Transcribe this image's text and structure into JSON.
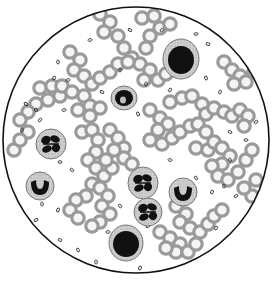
{
  "image": {
    "subject": "Blood smear viewed through microscope field",
    "width": 273,
    "height": 281
  },
  "field": {
    "cx": 136,
    "cy": 140,
    "r": 133,
    "border_color": "#111111",
    "bg": "#ffffff"
  },
  "colors": {
    "rbc_ring": "#9a9a9a",
    "rbc_center": "#f4f4f4",
    "wbc_cytoplasm": "#c8c8c8",
    "wbc_nucleus": "#111111",
    "platelet": "#333333"
  },
  "rbc_chains": [
    [
      [
        100,
        14
      ],
      [
        110,
        22
      ],
      [
        104,
        32
      ],
      [
        118,
        36
      ],
      [
        124,
        48
      ],
      [
        132,
        58
      ],
      [
        140,
        64
      ],
      [
        150,
        70
      ],
      [
        144,
        80
      ],
      [
        158,
        80
      ],
      [
        166,
        74
      ]
    ],
    [
      [
        70,
        52
      ],
      [
        80,
        60
      ],
      [
        74,
        70
      ],
      [
        84,
        76
      ],
      [
        92,
        84
      ],
      [
        100,
        78
      ],
      [
        110,
        72
      ],
      [
        118,
        64
      ],
      [
        128,
        62
      ]
    ],
    [
      [
        142,
        18
      ],
      [
        154,
        16
      ],
      [
        160,
        28
      ],
      [
        170,
        24
      ],
      [
        150,
        36
      ],
      [
        146,
        48
      ]
    ],
    [
      [
        40,
        88
      ],
      [
        52,
        86
      ],
      [
        60,
        96
      ],
      [
        48,
        100
      ],
      [
        36,
        104
      ],
      [
        28,
        112
      ],
      [
        20,
        120
      ],
      [
        28,
        132
      ]
    ],
    [
      [
        62,
        86
      ],
      [
        72,
        92
      ],
      [
        84,
        96
      ],
      [
        90,
        106
      ],
      [
        78,
        110
      ],
      [
        90,
        116
      ],
      [
        100,
        108
      ]
    ],
    [
      [
        14,
        150
      ],
      [
        20,
        140
      ]
    ],
    [
      [
        82,
        132
      ],
      [
        92,
        130
      ],
      [
        98,
        140
      ],
      [
        96,
        152
      ],
      [
        88,
        160
      ],
      [
        96,
        168
      ],
      [
        104,
        176
      ],
      [
        92,
        184
      ],
      [
        86,
        196
      ],
      [
        76,
        200
      ],
      [
        70,
        210
      ],
      [
        78,
        218
      ]
    ],
    [
      [
        110,
        130
      ],
      [
        118,
        138
      ],
      [
        124,
        148
      ],
      [
        114,
        150
      ],
      [
        124,
        158
      ],
      [
        132,
        164
      ],
      [
        112,
        168
      ],
      [
        106,
        160
      ]
    ],
    [
      [
        100,
        188
      ],
      [
        108,
        196
      ],
      [
        102,
        206
      ],
      [
        110,
        214
      ],
      [
        100,
        222
      ],
      [
        92,
        226
      ]
    ],
    [
      [
        170,
        102
      ],
      [
        182,
        98
      ],
      [
        192,
        96
      ],
      [
        202,
        104
      ],
      [
        206,
        114
      ],
      [
        214,
        108
      ],
      [
        224,
        112
      ],
      [
        232,
        116
      ],
      [
        240,
        110
      ],
      [
        248,
        116
      ],
      [
        244,
        126
      ]
    ],
    [
      [
        150,
        110
      ],
      [
        160,
        118
      ],
      [
        168,
        124
      ],
      [
        158,
        130
      ],
      [
        150,
        140
      ],
      [
        162,
        144
      ],
      [
        172,
        138
      ],
      [
        180,
        132
      ],
      [
        190,
        126
      ],
      [
        198,
        124
      ],
      [
        206,
        132
      ]
    ],
    [
      [
        196,
        148
      ],
      [
        208,
        150
      ],
      [
        214,
        142
      ],
      [
        222,
        148
      ],
      [
        230,
        156
      ],
      [
        222,
        164
      ],
      [
        212,
        166
      ],
      [
        218,
        176
      ],
      [
        228,
        180
      ],
      [
        238,
        172
      ],
      [
        246,
        160
      ],
      [
        252,
        150
      ]
    ],
    [
      [
        224,
        62
      ],
      [
        232,
        70
      ],
      [
        240,
        76
      ],
      [
        234,
        84
      ],
      [
        246,
        82
      ],
      [
        254,
        72
      ]
    ],
    [
      [
        176,
        206
      ],
      [
        186,
        214
      ],
      [
        180,
        222
      ],
      [
        190,
        228
      ],
      [
        200,
        232
      ],
      [
        208,
        224
      ],
      [
        214,
        216
      ],
      [
        222,
        210
      ]
    ],
    [
      [
        160,
        232
      ],
      [
        170,
        238
      ],
      [
        180,
        244
      ],
      [
        176,
        252
      ],
      [
        166,
        248
      ],
      [
        188,
        252
      ],
      [
        196,
        244
      ]
    ],
    [
      [
        252,
        196
      ],
      [
        244,
        188
      ],
      [
        256,
        180
      ]
    ]
  ],
  "wbcs": [
    {
      "type": "lymphocyte",
      "cx": 181,
      "cy": 59,
      "rx": 18,
      "ry": 20,
      "nucleus": "round",
      "nrx": 13,
      "nry": 14
    },
    {
      "type": "monocyte",
      "cx": 124,
      "cy": 98,
      "rx": 13,
      "ry": 12,
      "nucleus": "kidney",
      "nrx": 9,
      "nry": 8
    },
    {
      "type": "neutrophil",
      "cx": 51,
      "cy": 144,
      "rx": 15,
      "ry": 15,
      "nucleus": "lobed",
      "nrx": 10,
      "nry": 10
    },
    {
      "type": "band",
      "cx": 40,
      "cy": 186,
      "rx": 14,
      "ry": 14,
      "nucleus": "horseshoe",
      "nrx": 9,
      "nry": 9
    },
    {
      "type": "neutrophil",
      "cx": 143,
      "cy": 183,
      "rx": 15,
      "ry": 16,
      "nucleus": "lobed",
      "nrx": 11,
      "nry": 11
    },
    {
      "type": "neutrophil",
      "cx": 148,
      "cy": 212,
      "rx": 14,
      "ry": 14,
      "nucleus": "lobed",
      "nrx": 10,
      "nry": 10
    },
    {
      "type": "band",
      "cx": 183,
      "cy": 192,
      "rx": 14,
      "ry": 14,
      "nucleus": "horseshoe",
      "nrx": 9,
      "nry": 9
    },
    {
      "type": "lymphocyte",
      "cx": 126,
      "cy": 243,
      "rx": 17,
      "ry": 18,
      "nucleus": "round",
      "nrx": 13,
      "nry": 13
    }
  ],
  "platelets": [
    [
      58,
      62
    ],
    [
      54,
      78
    ],
    [
      68,
      80
    ],
    [
      26,
      104
    ],
    [
      36,
      110
    ],
    [
      22,
      130
    ],
    [
      40,
      120
    ],
    [
      64,
      110
    ],
    [
      102,
      92
    ],
    [
      138,
      114
    ],
    [
      146,
      84
    ],
    [
      162,
      30
    ],
    [
      196,
      34
    ],
    [
      208,
      44
    ],
    [
      206,
      78
    ],
    [
      220,
      92
    ],
    [
      256,
      122
    ],
    [
      246,
      140
    ],
    [
      230,
      132
    ],
    [
      230,
      160
    ],
    [
      212,
      192
    ],
    [
      236,
      196
    ],
    [
      60,
      162
    ],
    [
      72,
      170
    ],
    [
      42,
      204
    ],
    [
      58,
      210
    ],
    [
      36,
      220
    ],
    [
      108,
      232
    ],
    [
      120,
      206
    ],
    [
      96,
      262
    ],
    [
      140,
      268
    ],
    [
      148,
      226
    ],
    [
      170,
      160
    ],
    [
      196,
      178
    ],
    [
      224,
      186
    ],
    [
      216,
      228
    ],
    [
      200,
      258
    ],
    [
      60,
      240
    ],
    [
      78,
      250
    ],
    [
      120,
      70
    ],
    [
      170,
      90
    ],
    [
      90,
      40
    ],
    [
      130,
      30
    ],
    [
      246,
      60
    ]
  ]
}
